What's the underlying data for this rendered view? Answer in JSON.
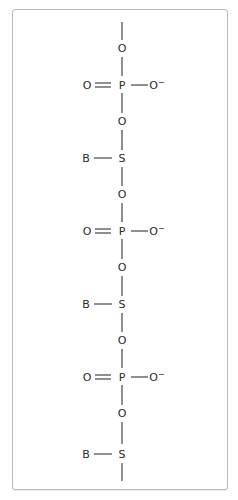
{
  "diagram": {
    "backbone_atoms": [
      "O",
      "P",
      "O",
      "S",
      "O",
      "P",
      "O",
      "S",
      "O",
      "P",
      "O",
      "S"
    ],
    "units": [
      {
        "phosphate": {
          "bridge_top": "O",
          "center": "P",
          "double_bond": "O",
          "single_bond": "O⁻",
          "bridge_bottom": "O"
        },
        "sugar": {
          "center": "S",
          "base": "B"
        }
      },
      {
        "phosphate": {
          "bridge_top": "O",
          "center": "P",
          "double_bond": "O",
          "single_bond": "O⁻",
          "bridge_bottom": "O"
        },
        "sugar": {
          "center": "S",
          "base": "B"
        }
      },
      {
        "phosphate": {
          "bridge_top": "O",
          "center": "P",
          "double_bond": "O",
          "single_bond": "O⁻",
          "bridge_bottom": "O"
        },
        "sugar": {
          "center": "S",
          "base": "B"
        }
      }
    ],
    "labels": {
      "oxygen": "O",
      "phosphorus": "P",
      "sugar": "S",
      "base": "B",
      "oxide_anion": "O",
      "anion_charge": "−"
    },
    "colors": {
      "ink": "#2a2a2a",
      "frame": "#b9b9b9"
    }
  }
}
